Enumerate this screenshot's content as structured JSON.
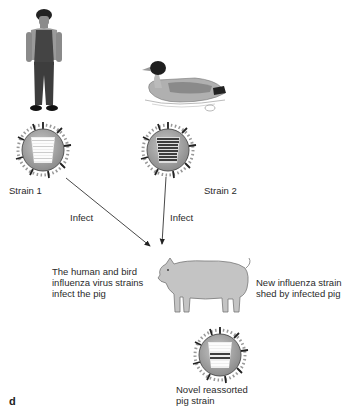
{
  "figure": {
    "panel_label": "d",
    "nodes": {
      "human": {
        "label": "human-figure"
      },
      "bird": {
        "label": "duck-figure"
      },
      "pig": {
        "label": "pig-figure"
      }
    },
    "strains": [
      {
        "label": "Strain 1",
        "segment_style": "light"
      },
      {
        "label": "Strain 2",
        "segment_style": "dark"
      },
      {
        "label_line1": "Novel reassorted",
        "label_line2": "pig strain",
        "segment_style": "mixed"
      }
    ],
    "arrows": [
      {
        "label": "Infect",
        "from": "Strain 1",
        "to": "pig"
      },
      {
        "label": "Infect",
        "from": "Strain 2",
        "to": "pig"
      }
    ],
    "annotations": {
      "left": {
        "line1": "The human and bird",
        "line2": "influenza virus strains",
        "line3": "infect the pig"
      },
      "right": {
        "line1": "New influenza strain",
        "line2": "shed by infected pig"
      }
    },
    "colors": {
      "virus_fill": "#9a9a9a",
      "virus_outline": "#555555",
      "spike_dark": "#222222",
      "spike_light": "#8a8a8a",
      "segment_light": "#ffffff",
      "segment_dark": "#2b2b2b",
      "arrow": "#333333"
    }
  }
}
